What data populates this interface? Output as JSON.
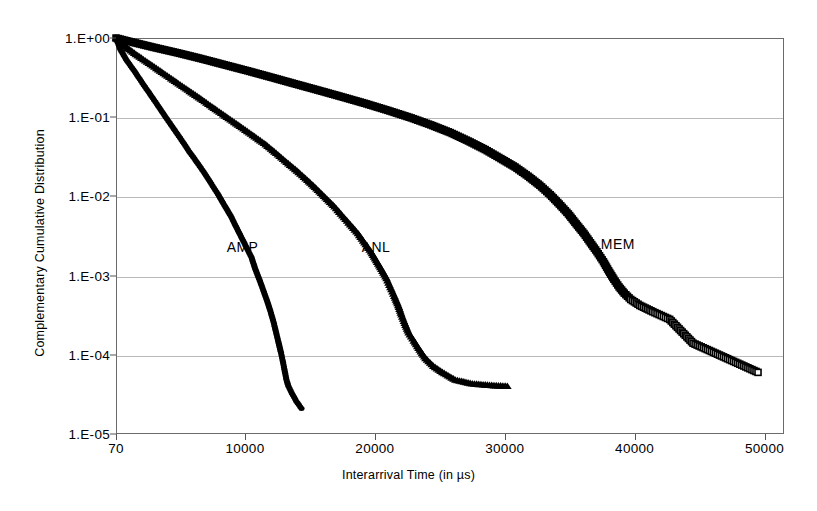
{
  "chart_data": {
    "type": "scatter",
    "title": "",
    "xlabel": "Interarrival Time (in µs)",
    "ylabel": "Complementary Cumulative Distribution",
    "xlim": [
      70,
      51500
    ],
    "ylim": [
      1e-05,
      1
    ],
    "yscale": "log",
    "xscale": "linear",
    "grid": "horizontal",
    "legend": "inline-annotations",
    "xticks": [
      {
        "value": 70,
        "label": "70"
      },
      {
        "value": 10000,
        "label": "10000"
      },
      {
        "value": 20000,
        "label": "20000"
      },
      {
        "value": 30000,
        "label": "30000"
      },
      {
        "value": 40000,
        "label": "40000"
      },
      {
        "value": 50000,
        "label": "50000"
      }
    ],
    "yticks": [
      {
        "value": 1,
        "label": "1.E+00"
      },
      {
        "value": 0.1,
        "label": "1.E-01"
      },
      {
        "value": 0.01,
        "label": "1.E-02"
      },
      {
        "value": 0.001,
        "label": "1.E-03"
      },
      {
        "value": 0.0001,
        "label": "1.E-04"
      },
      {
        "value": 1e-05,
        "label": "1.E-05"
      }
    ],
    "annotations": [
      {
        "text": "AMP",
        "x": 8600,
        "y": 0.0022
      },
      {
        "text": "ANL",
        "x": 19000,
        "y": 0.0022
      },
      {
        "text": "MEM",
        "x": 37400,
        "y": 0.0024
      }
    ],
    "series": [
      {
        "name": "AMP",
        "marker": "filled-circle",
        "color": "#000000",
        "points": [
          [
            70,
            1.0
          ],
          [
            400,
            0.72
          ],
          [
            900,
            0.52
          ],
          [
            1500,
            0.38
          ],
          [
            2100,
            0.27
          ],
          [
            2700,
            0.195
          ],
          [
            3300,
            0.14
          ],
          [
            3900,
            0.1
          ],
          [
            4500,
            0.072
          ],
          [
            5100,
            0.052
          ],
          [
            5700,
            0.037
          ],
          [
            6300,
            0.027
          ],
          [
            6900,
            0.0195
          ],
          [
            7400,
            0.0145
          ],
          [
            7900,
            0.0108
          ],
          [
            8400,
            0.0078
          ],
          [
            8900,
            0.0057
          ],
          [
            9300,
            0.0042
          ],
          [
            9700,
            0.0031
          ],
          [
            10100,
            0.0023
          ],
          [
            10500,
            0.0017
          ],
          [
            10800,
            0.0012
          ],
          [
            11100,
            0.0009
          ],
          [
            11400,
            0.00066
          ],
          [
            11700,
            0.00048
          ],
          [
            11950,
            0.00036
          ],
          [
            12200,
            0.00026
          ],
          [
            12400,
            0.00019
          ],
          [
            12600,
            0.00014
          ],
          [
            12780,
            0.000105
          ],
          [
            12900,
            8.5e-05
          ],
          [
            13000,
            7e-05
          ],
          [
            13100,
            5.8e-05
          ],
          [
            13200,
            4.8e-05
          ],
          [
            13350,
            4e-05
          ],
          [
            13600,
            3.3e-05
          ],
          [
            13950,
            2.6e-05
          ],
          [
            14350,
            2.1e-05
          ]
        ]
      },
      {
        "name": "ANL",
        "marker": "filled-triangle",
        "color": "#000000",
        "points": [
          [
            70,
            1.0
          ],
          [
            700,
            0.8
          ],
          [
            1600,
            0.62
          ],
          [
            2600,
            0.48
          ],
          [
            3600,
            0.37
          ],
          [
            4600,
            0.285
          ],
          [
            5600,
            0.22
          ],
          [
            6600,
            0.17
          ],
          [
            7600,
            0.13
          ],
          [
            8600,
            0.1
          ],
          [
            9600,
            0.077
          ],
          [
            10600,
            0.059
          ],
          [
            11600,
            0.045
          ],
          [
            12400,
            0.035
          ],
          [
            13200,
            0.027
          ],
          [
            14000,
            0.021
          ],
          [
            14800,
            0.016
          ],
          [
            15500,
            0.0125
          ],
          [
            16200,
            0.0096
          ],
          [
            16900,
            0.0074
          ],
          [
            17500,
            0.0057
          ],
          [
            18100,
            0.0044
          ],
          [
            18700,
            0.0034
          ],
          [
            19200,
            0.0026
          ],
          [
            19700,
            0.002
          ],
          [
            20100,
            0.00155
          ],
          [
            20500,
            0.0012
          ],
          [
            20900,
            0.00092
          ],
          [
            21200,
            0.00071
          ],
          [
            21500,
            0.00055
          ],
          [
            21800,
            0.00042
          ],
          [
            22050,
            0.00032
          ],
          [
            22300,
            0.00025
          ],
          [
            22600,
            0.00019
          ],
          [
            23000,
            0.00015
          ],
          [
            23450,
            0.000115
          ],
          [
            23900,
            9e-05
          ],
          [
            24500,
            7.2e-05
          ],
          [
            25200,
            6e-05
          ],
          [
            26200,
            4.8e-05
          ],
          [
            27500,
            4.3e-05
          ],
          [
            29000,
            4.1e-05
          ],
          [
            30200,
            4e-05
          ]
        ]
      },
      {
        "name": "MEM",
        "marker": "open-square",
        "color": "#000000",
        "points": [
          [
            70,
            1.0
          ],
          [
            1400,
            0.88
          ],
          [
            3000,
            0.76
          ],
          [
            4800,
            0.65
          ],
          [
            6600,
            0.55
          ],
          [
            8400,
            0.46
          ],
          [
            10200,
            0.385
          ],
          [
            12000,
            0.32
          ],
          [
            13800,
            0.265
          ],
          [
            15600,
            0.22
          ],
          [
            17400,
            0.182
          ],
          [
            19200,
            0.15
          ],
          [
            21000,
            0.122
          ],
          [
            22800,
            0.098
          ],
          [
            24300,
            0.08
          ],
          [
            25800,
            0.064
          ],
          [
            27200,
            0.05
          ],
          [
            28500,
            0.039
          ],
          [
            29700,
            0.03
          ],
          [
            30800,
            0.0235
          ],
          [
            31800,
            0.018
          ],
          [
            32700,
            0.0138
          ],
          [
            33500,
            0.0105
          ],
          [
            34200,
            0.008
          ],
          [
            34900,
            0.006
          ],
          [
            35500,
            0.0045
          ],
          [
            36100,
            0.0034
          ],
          [
            36600,
            0.0026
          ],
          [
            37100,
            0.002
          ],
          [
            37600,
            0.0015
          ],
          [
            38000,
            0.00115
          ],
          [
            38400,
            0.0009
          ],
          [
            38800,
            0.00072
          ],
          [
            39200,
            0.0006
          ],
          [
            39700,
            0.0005
          ],
          [
            40400,
            0.00042
          ],
          [
            41400,
            0.00035
          ],
          [
            42700,
            0.00028
          ],
          [
            44500,
            0.00014
          ],
          [
            49500,
            6e-05
          ]
        ]
      }
    ]
  }
}
